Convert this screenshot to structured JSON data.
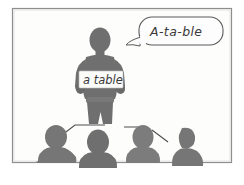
{
  "illustration": {
    "title": "Teacher showing a flashcard to students",
    "frame": {
      "border_color": "#8e8e8e",
      "background_color": "#fdfdfc",
      "outer_background": "#ffffff"
    },
    "palette": {
      "silhouette_dark": "#6f6f6f",
      "silhouette_mid": "#767676",
      "silhouette_light": "#8a8a8a",
      "ink": "#3a3a3a",
      "card_fill": "#fbfbfa",
      "bubble_fill": "#fdfdfd"
    },
    "speech_bubble": {
      "text": "A-ta-ble",
      "shape": "rounded-rectangle-with-tail",
      "tail_direction": "bottom-left"
    },
    "flashcard": {
      "text": "a table",
      "held_by": "teacher"
    },
    "teacher": {
      "label": "teacher-figure",
      "pose": "standing, holding card at chest"
    },
    "students": [
      {
        "label": "student-1",
        "facing": "back"
      },
      {
        "label": "student-2",
        "facing": "back"
      },
      {
        "label": "student-3",
        "facing": "back"
      },
      {
        "label": "student-4",
        "facing": "profile-left"
      }
    ],
    "pointer_lines": [
      {
        "label": "pointer-left",
        "from": "teacher",
        "to": "student-1"
      },
      {
        "label": "pointer-right",
        "from": "teacher",
        "to": "student-4"
      }
    ]
  }
}
